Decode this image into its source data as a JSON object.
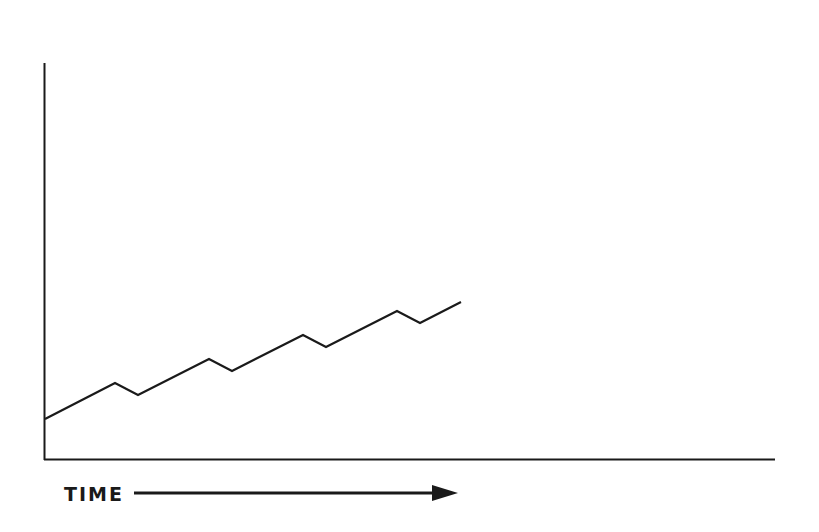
{
  "chart_data": {
    "type": "line",
    "title": "",
    "xlabel": "TIME",
    "ylabel": "",
    "grid": false,
    "legend": null,
    "series": [
      {
        "name": "trend",
        "points_px": [
          [
            45,
            419
          ],
          [
            115,
            383
          ],
          [
            138,
            395
          ],
          [
            209,
            359
          ],
          [
            232,
            371
          ],
          [
            303,
            335
          ],
          [
            326,
            347
          ],
          [
            397,
            311
          ],
          [
            420,
            323
          ],
          [
            461,
            302
          ]
        ]
      }
    ]
  },
  "labels": {
    "x_axis": "TIME"
  },
  "colors": {
    "ink": "#1a1a1a",
    "background": "#ffffff"
  }
}
